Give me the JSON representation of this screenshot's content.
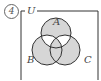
{
  "problem_number": "4",
  "universe_label": "U",
  "sets": [
    {
      "name": "A"
    },
    {
      "name": "B"
    },
    {
      "name": "C"
    }
  ],
  "shaded_regions": [
    "A only",
    "B only",
    "C only",
    "B∩C only",
    "A∩B∩C"
  ],
  "unshaded_regions": [
    "A∩B only",
    "A∩C only",
    "outside"
  ],
  "colors": {
    "shade": "#d6d6d6",
    "line": "#333333"
  }
}
